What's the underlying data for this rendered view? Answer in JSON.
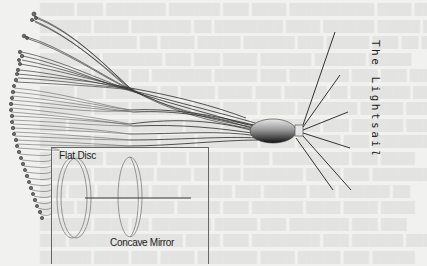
{
  "diagram": {
    "title": "The Lightsail",
    "title_main": "The Lightsai",
    "title_tail": "l",
    "inset": {
      "labels": {
        "flat_disc": "Flat Disc",
        "concave_mirror": "Concave Mirror"
      }
    }
  },
  "colors": {
    "background": "#f1f1ef",
    "line": "#2a2a2a",
    "inset_border": "#666666",
    "disc_stroke": "#8a8a8a"
  }
}
